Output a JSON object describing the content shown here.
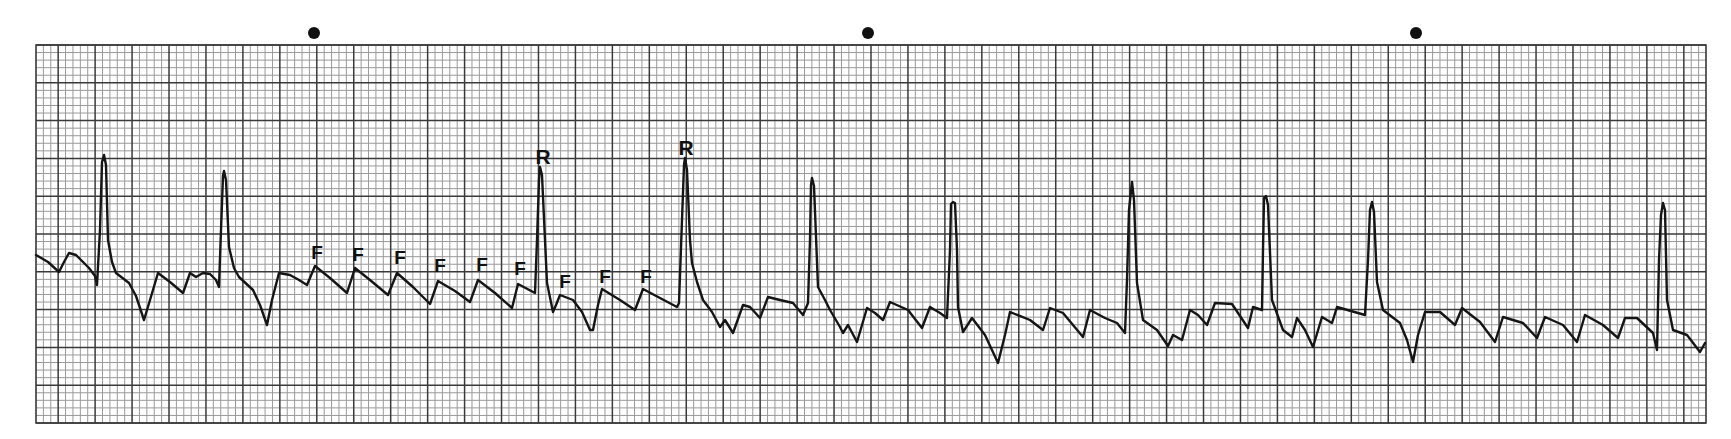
{
  "strip": {
    "description": "ECG rhythm strip with flutter waves labeled F and R waves labeled R",
    "paper": {
      "x0": 36,
      "y0": 45,
      "x1": 1706,
      "y1": 423,
      "small_box_px": 7.4,
      "large_box_px": 37.0,
      "minor_color": "#9a9a9a",
      "major_color": "#3a3a3a",
      "background": "#ffffff"
    },
    "trace_color": "#151515",
    "time_markers": [
      {
        "x": 314,
        "y": 33
      },
      {
        "x": 868,
        "y": 33
      },
      {
        "x": 1416,
        "y": 33
      }
    ],
    "labels": [
      {
        "text": "F",
        "x": 317,
        "y": 243,
        "type": "flutter"
      },
      {
        "text": "F",
        "x": 358,
        "y": 245,
        "type": "flutter"
      },
      {
        "text": "F",
        "x": 400,
        "y": 248,
        "type": "flutter"
      },
      {
        "text": "F",
        "x": 440,
        "y": 256,
        "type": "flutter"
      },
      {
        "text": "F",
        "x": 482,
        "y": 255,
        "type": "flutter"
      },
      {
        "text": "F",
        "x": 520,
        "y": 259,
        "type": "flutter"
      },
      {
        "text": "R",
        "x": 543,
        "y": 146,
        "type": "r-wave"
      },
      {
        "text": "F",
        "x": 565,
        "y": 272,
        "type": "flutter"
      },
      {
        "text": "F",
        "x": 605,
        "y": 267,
        "type": "flutter"
      },
      {
        "text": "F",
        "x": 646,
        "y": 267,
        "type": "flutter"
      },
      {
        "text": "R",
        "x": 686,
        "y": 137,
        "type": "r-wave"
      }
    ]
  },
  "chart_data": {
    "type": "line",
    "xlabel": "",
    "ylabel": "",
    "grid": true,
    "annotations": [
      "F",
      "F",
      "F",
      "F",
      "F",
      "F",
      "R",
      "F",
      "F",
      "F",
      "R"
    ],
    "time_markers_px": [
      314,
      868,
      1416
    ],
    "r_peaks_px": [
      [
        104,
        155
      ],
      [
        224,
        171
      ],
      [
        540,
        167
      ],
      [
        685,
        158
      ],
      [
        812,
        178
      ],
      [
        953,
        202
      ],
      [
        1132,
        182
      ],
      [
        1265,
        195
      ],
      [
        1372,
        202
      ],
      [
        1663,
        203
      ]
    ],
    "trace": [
      [
        36,
        255
      ],
      [
        48,
        262
      ],
      [
        59,
        272
      ],
      [
        64,
        262
      ],
      [
        69,
        253
      ],
      [
        76,
        255
      ],
      [
        89,
        268
      ],
      [
        95,
        276
      ],
      [
        97,
        285
      ],
      [
        100,
        230
      ],
      [
        102,
        162
      ],
      [
        104,
        155
      ],
      [
        106,
        165
      ],
      [
        108,
        240
      ],
      [
        112,
        262
      ],
      [
        116,
        273
      ],
      [
        129,
        283
      ],
      [
        136,
        296
      ],
      [
        144,
        320
      ],
      [
        150,
        300
      ],
      [
        158,
        273
      ],
      [
        170,
        282
      ],
      [
        183,
        293
      ],
      [
        190,
        273
      ],
      [
        196,
        277
      ],
      [
        203,
        273
      ],
      [
        210,
        274
      ],
      [
        216,
        280
      ],
      [
        219,
        287
      ],
      [
        221,
        230
      ],
      [
        223,
        176
      ],
      [
        224,
        171
      ],
      [
        226,
        180
      ],
      [
        229,
        247
      ],
      [
        234,
        268
      ],
      [
        239,
        277
      ],
      [
        253,
        290
      ],
      [
        260,
        305
      ],
      [
        267,
        325
      ],
      [
        272,
        300
      ],
      [
        279,
        273
      ],
      [
        290,
        275
      ],
      [
        299,
        280
      ],
      [
        307,
        285
      ],
      [
        315,
        266
      ],
      [
        330,
        278
      ],
      [
        347,
        293
      ],
      [
        355,
        268
      ],
      [
        370,
        280
      ],
      [
        388,
        295
      ],
      [
        397,
        273
      ],
      [
        413,
        287
      ],
      [
        430,
        304
      ],
      [
        438,
        281
      ],
      [
        455,
        291
      ],
      [
        470,
        302
      ],
      [
        478,
        280
      ],
      [
        495,
        293
      ],
      [
        512,
        308
      ],
      [
        518,
        284
      ],
      [
        535,
        293
      ],
      [
        537,
        240
      ],
      [
        539,
        180
      ],
      [
        540,
        167
      ],
      [
        542,
        175
      ],
      [
        545,
        240
      ],
      [
        547,
        283
      ],
      [
        553,
        312
      ],
      [
        556,
        305
      ],
      [
        560,
        295
      ],
      [
        573,
        300
      ],
      [
        582,
        312
      ],
      [
        590,
        330
      ],
      [
        593,
        330
      ],
      [
        598,
        305
      ],
      [
        602,
        289
      ],
      [
        620,
        300
      ],
      [
        635,
        310
      ],
      [
        643,
        289
      ],
      [
        660,
        298
      ],
      [
        677,
        307
      ],
      [
        679,
        303
      ],
      [
        682,
        220
      ],
      [
        684,
        165
      ],
      [
        685,
        158
      ],
      [
        687,
        170
      ],
      [
        690,
        240
      ],
      [
        692,
        263
      ],
      [
        697,
        282
      ],
      [
        703,
        300
      ],
      [
        712,
        312
      ],
      [
        720,
        327
      ],
      [
        725,
        320
      ],
      [
        733,
        333
      ],
      [
        743,
        305
      ],
      [
        750,
        307
      ],
      [
        760,
        318
      ],
      [
        768,
        297
      ],
      [
        780,
        300
      ],
      [
        793,
        303
      ],
      [
        803,
        315
      ],
      [
        808,
        303
      ],
      [
        810,
        240
      ],
      [
        811,
        185
      ],
      [
        812,
        178
      ],
      [
        814,
        186
      ],
      [
        818,
        287
      ],
      [
        825,
        300
      ],
      [
        830,
        310
      ],
      [
        840,
        327
      ],
      [
        843,
        333
      ],
      [
        848,
        325
      ],
      [
        857,
        342
      ],
      [
        867,
        308
      ],
      [
        875,
        313
      ],
      [
        883,
        320
      ],
      [
        890,
        302
      ],
      [
        908,
        310
      ],
      [
        922,
        328
      ],
      [
        930,
        307
      ],
      [
        940,
        313
      ],
      [
        947,
        318
      ],
      [
        950,
        250
      ],
      [
        951,
        204
      ],
      [
        953,
        202
      ],
      [
        955,
        203
      ],
      [
        957,
        250
      ],
      [
        958,
        307
      ],
      [
        963,
        332
      ],
      [
        972,
        318
      ],
      [
        985,
        335
      ],
      [
        998,
        363
      ],
      [
        1005,
        335
      ],
      [
        1010,
        312
      ],
      [
        1030,
        320
      ],
      [
        1043,
        330
      ],
      [
        1050,
        308
      ],
      [
        1063,
        313
      ],
      [
        1083,
        337
      ],
      [
        1090,
        310
      ],
      [
        1105,
        318
      ],
      [
        1117,
        323
      ],
      [
        1125,
        333
      ],
      [
        1127,
        280
      ],
      [
        1129,
        210
      ],
      [
        1132,
        182
      ],
      [
        1134,
        200
      ],
      [
        1137,
        283
      ],
      [
        1143,
        320
      ],
      [
        1157,
        330
      ],
      [
        1168,
        346
      ],
      [
        1173,
        335
      ],
      [
        1182,
        340
      ],
      [
        1190,
        310
      ],
      [
        1198,
        315
      ],
      [
        1207,
        325
      ],
      [
        1215,
        303
      ],
      [
        1232,
        304
      ],
      [
        1248,
        328
      ],
      [
        1253,
        307
      ],
      [
        1262,
        310
      ],
      [
        1263,
        250
      ],
      [
        1264,
        198
      ],
      [
        1266,
        196
      ],
      [
        1268,
        205
      ],
      [
        1272,
        300
      ],
      [
        1283,
        330
      ],
      [
        1292,
        337
      ],
      [
        1297,
        318
      ],
      [
        1305,
        330
      ],
      [
        1313,
        347
      ],
      [
        1322,
        317
      ],
      [
        1332,
        323
      ],
      [
        1337,
        307
      ],
      [
        1365,
        315
      ],
      [
        1368,
        260
      ],
      [
        1370,
        210
      ],
      [
        1372,
        202
      ],
      [
        1374,
        212
      ],
      [
        1377,
        282
      ],
      [
        1383,
        310
      ],
      [
        1400,
        323
      ],
      [
        1407,
        340
      ],
      [
        1413,
        362
      ],
      [
        1418,
        335
      ],
      [
        1425,
        312
      ],
      [
        1440,
        312
      ],
      [
        1455,
        325
      ],
      [
        1462,
        308
      ],
      [
        1480,
        322
      ],
      [
        1495,
        342
      ],
      [
        1503,
        317
      ],
      [
        1523,
        323
      ],
      [
        1537,
        338
      ],
      [
        1545,
        317
      ],
      [
        1563,
        325
      ],
      [
        1577,
        342
      ],
      [
        1585,
        315
      ],
      [
        1603,
        325
      ],
      [
        1618,
        338
      ],
      [
        1625,
        318
      ],
      [
        1637,
        318
      ],
      [
        1653,
        333
      ],
      [
        1657,
        350
      ],
      [
        1659,
        260
      ],
      [
        1661,
        215
      ],
      [
        1663,
        203
      ],
      [
        1665,
        210
      ],
      [
        1667,
        300
      ],
      [
        1673,
        330
      ],
      [
        1687,
        335
      ],
      [
        1700,
        352
      ],
      [
        1705,
        343
      ]
    ]
  }
}
